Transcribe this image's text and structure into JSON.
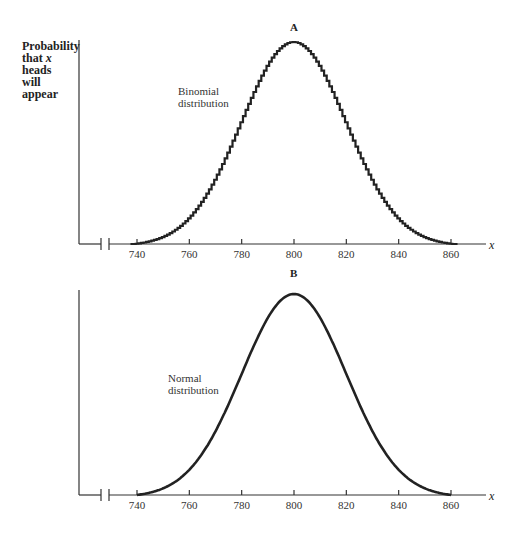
{
  "figure": {
    "ylabel_lines": [
      "Probability",
      "that",
      "x",
      "heads",
      "will",
      "appear"
    ],
    "ylabel_text": "Probability that x heads will appear"
  },
  "chart_data": [
    {
      "type": "bar",
      "panel": "A",
      "title": "A",
      "annotation": "Binomial distribution",
      "annotation_lines": [
        "Binomial",
        "distribution"
      ],
      "xlabel": "x",
      "ylabel": "Probability that x heads will appear",
      "x_ticks": [
        740,
        760,
        780,
        800,
        820,
        840,
        860
      ],
      "xlim": [
        738,
        862
      ],
      "axis_break": true,
      "grid": false,
      "style": "step histogram",
      "mean": 800,
      "sd": 20,
      "description": "Stepped histogram of binomial probabilities, peaked at x=800, approaching zero near 738 and 862"
    },
    {
      "type": "line",
      "panel": "B",
      "title": "B",
      "annotation": "Normal distribution",
      "annotation_lines": [
        "Normal",
        "distribution"
      ],
      "xlabel": "x",
      "ylabel": "Probability that x heads will appear",
      "x_ticks": [
        740,
        760,
        780,
        800,
        820,
        840,
        860
      ],
      "xlim": [
        740,
        860
      ],
      "axis_break": true,
      "grid": false,
      "style": "smooth curve",
      "mean": 800,
      "sd": 20,
      "description": "Smooth bell-shaped normal curve peaked at x=800, from 740 to 860"
    }
  ],
  "panels": {
    "a": {
      "title": "A",
      "label1": "Binomial",
      "label2": "distribution",
      "xvar": "x",
      "ticks": [
        "740",
        "760",
        "780",
        "800",
        "820",
        "840",
        "860"
      ]
    },
    "b": {
      "title": "B",
      "label1": "Normal",
      "label2": "distribution",
      "xvar": "x",
      "ticks": [
        "740",
        "760",
        "780",
        "800",
        "820",
        "840",
        "860"
      ]
    }
  },
  "colors": {
    "ink": "#222222",
    "background": "#ffffff"
  }
}
